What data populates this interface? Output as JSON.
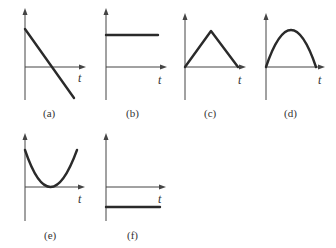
{
  "figure": {
    "axis_label": "t",
    "panels": [
      {
        "id": "a",
        "caption": "(a)",
        "shape": "linear-decreasing",
        "description": "line starting above t-axis decreasing through zero to negative"
      },
      {
        "id": "b",
        "caption": "(b)",
        "shape": "constant-positive",
        "description": "horizontal line above t-axis"
      },
      {
        "id": "c",
        "caption": "(c)",
        "shape": "triangle",
        "description": "rises linearly from zero to peak then falls linearly back to zero"
      },
      {
        "id": "d",
        "caption": "(d)",
        "shape": "inverted-parabola",
        "description": "arch from zero up to peak and back to zero"
      },
      {
        "id": "e",
        "caption": "(e)",
        "shape": "parabola",
        "description": "U-shaped curve touching t-axis at minimum"
      },
      {
        "id": "f",
        "caption": "(f)",
        "shape": "constant-negative",
        "description": "horizontal line below t-axis"
      }
    ]
  }
}
